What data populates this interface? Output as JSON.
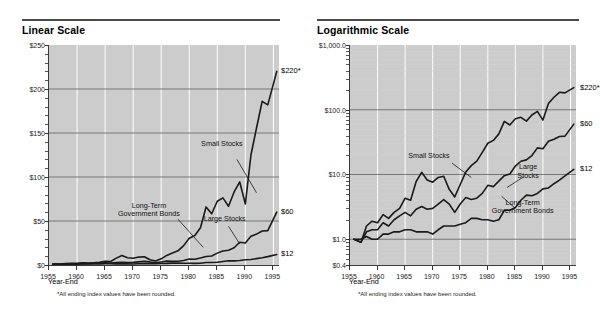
{
  "figure": {
    "width": 594,
    "height": 313,
    "background_color": "#ffffff",
    "plot_background_color": "#cccccc",
    "gridline_color": "#ffffff",
    "line_color": "#1a1a1a"
  },
  "panels": [
    {
      "key": "linear",
      "title": "Linear Scale",
      "axis_caption": "Year-End",
      "footnote": "*All ending index values have been rounded."
    },
    {
      "key": "log",
      "title": "Logarithmic Scale",
      "axis_caption": "Year-End",
      "footnote": "*All ending index values have been rounded."
    }
  ],
  "chart_data": [
    {
      "type": "line",
      "title": "Linear Scale",
      "xlabel": "Year-End",
      "ylabel": "",
      "scale": "linear",
      "xlim": [
        1955,
        1996
      ],
      "ylim": [
        0,
        250
      ],
      "grid": true,
      "legend": "annotations",
      "yticks": [
        0,
        50,
        100,
        150,
        200,
        250
      ],
      "yticklabels": [
        "$0",
        "$50",
        "$100",
        "$150",
        "$200",
        "$250"
      ],
      "xticks": [
        1955,
        1960,
        1965,
        1970,
        1975,
        1980,
        1985,
        1990,
        1995
      ],
      "xticklabels": [
        "1955",
        "1960",
        "1965",
        "1970",
        "1975",
        "1980",
        "1985",
        "1990",
        "1995"
      ],
      "annotations": [
        {
          "text": "Small Stocks",
          "x": 1986,
          "y": 137
        },
        {
          "text": "Long-Term\nGovernment Bonds",
          "x": 1973,
          "y": 62
        },
        {
          "text": "Large Stocks",
          "x": 1986.5,
          "y": 52
        }
      ],
      "end_labels": [
        {
          "text": "$220*",
          "value": 220,
          "series": "Small Stocks"
        },
        {
          "text": "$60",
          "value": 60,
          "series": "Large Stocks"
        },
        {
          "text": "$12",
          "value": 12,
          "series": "Long-Term Government Bonds"
        }
      ],
      "series": [
        {
          "name": "Small Stocks",
          "x": [
            1955.7,
            1957,
            1958,
            1959,
            1960,
            1961,
            1962,
            1963,
            1964,
            1965,
            1966,
            1967,
            1968,
            1969,
            1970,
            1971,
            1972,
            1973,
            1974,
            1975,
            1976,
            1977,
            1978,
            1979,
            1980,
            1981,
            1982,
            1983,
            1984,
            1985,
            1986,
            1987,
            1988,
            1989,
            1990,
            1991,
            1992,
            1993,
            1994,
            1995.6
          ],
          "values": [
            1.0,
            0.9,
            1.6,
            1.9,
            1.8,
            2.4,
            2.1,
            2.6,
            3.0,
            4.3,
            4.0,
            7.8,
            10.8,
            8.2,
            7.6,
            9.0,
            9.4,
            5.9,
            4.5,
            7.0,
            10.9,
            13.7,
            16.1,
            22.0,
            30.4,
            33.6,
            42.4,
            66.0,
            58.2,
            72.4,
            76.3,
            66.7,
            83.0,
            94.4,
            69.3,
            125.0,
            156.0,
            186.0,
            182.0,
            220.0
          ]
        },
        {
          "name": "Large Stocks",
          "x": [
            1955.7,
            1957,
            1958,
            1959,
            1960,
            1961,
            1962,
            1963,
            1964,
            1965,
            1966,
            1967,
            1968,
            1969,
            1970,
            1971,
            1972,
            1973,
            1974,
            1975,
            1976,
            1977,
            1978,
            1979,
            1980,
            1981,
            1982,
            1983,
            1984,
            1985,
            1986,
            1987,
            1988,
            1989,
            1990,
            1991,
            1992,
            1993,
            1994,
            1995.6
          ],
          "values": [
            1.0,
            0.9,
            1.3,
            1.4,
            1.4,
            1.8,
            1.6,
            2.0,
            2.3,
            2.6,
            2.3,
            2.9,
            3.2,
            2.9,
            3.0,
            3.5,
            4.1,
            3.5,
            2.6,
            3.5,
            4.4,
            4.1,
            4.3,
            5.1,
            6.8,
            6.5,
            7.9,
            9.6,
            10.2,
            13.5,
            16.0,
            16.8,
            19.6,
            25.8,
            25.0,
            32.6,
            35.1,
            38.6,
            39.1,
            60.0
          ]
        },
        {
          "name": "Long-Term Government Bonds",
          "x": [
            1955.7,
            1957,
            1958,
            1959,
            1960,
            1961,
            1962,
            1963,
            1964,
            1965,
            1966,
            1967,
            1968,
            1969,
            1970,
            1971,
            1972,
            1973,
            1974,
            1975,
            1976,
            1977,
            1978,
            1979,
            1980,
            1981,
            1982,
            1983,
            1984,
            1985,
            1986,
            1987,
            1988,
            1989,
            1990,
            1991,
            1992,
            1993,
            1994,
            1995.6
          ],
          "values": [
            1.0,
            1.0,
            1.1,
            1.0,
            1.0,
            1.2,
            1.2,
            1.3,
            1.3,
            1.4,
            1.4,
            1.3,
            1.3,
            1.3,
            1.2,
            1.4,
            1.6,
            1.6,
            1.6,
            1.7,
            1.8,
            2.1,
            2.1,
            2.0,
            2.0,
            1.9,
            2.0,
            2.8,
            2.8,
            3.1,
            4.0,
            4.8,
            4.7,
            5.1,
            6.0,
            6.2,
            7.2,
            8.2,
            9.5,
            12.0
          ]
        }
      ]
    },
    {
      "type": "line",
      "title": "Logarithmic Scale",
      "xlabel": "Year-End",
      "ylabel": "",
      "scale": "log",
      "xlim": [
        1955,
        1996
      ],
      "ylim": [
        0.4,
        1000
      ],
      "grid": true,
      "legend": "annotations",
      "yticks": [
        0.4,
        1,
        10,
        100,
        1000
      ],
      "yticklabels": [
        "$0.4",
        "$1.0",
        "$10.0",
        "$100.0",
        "$1,000.0"
      ],
      "xticks": [
        1955,
        1960,
        1965,
        1970,
        1975,
        1980,
        1985,
        1990,
        1995
      ],
      "xticklabels": [
        "1955",
        "1960",
        "1965",
        "1970",
        "1975",
        "1980",
        "1985",
        "1990",
        "1995"
      ],
      "annotations": [
        {
          "text": "Small Stocks",
          "x": 1969.5,
          "y": 19
        },
        {
          "text": "Large\nStocks",
          "x": 1987.5,
          "y": 11
        },
        {
          "text": "Long-Term\nGovernment Bonds",
          "x": 1986.5,
          "y": 3.1
        }
      ],
      "end_labels": [
        {
          "text": "$220*",
          "value": 220,
          "series": "Small Stocks"
        },
        {
          "text": "$60",
          "value": 60,
          "series": "Large Stocks"
        },
        {
          "text": "$12",
          "value": 12,
          "series": "Long-Term Government Bonds"
        }
      ],
      "series": [
        {
          "name": "Small Stocks",
          "x": [
            1955.7,
            1957,
            1958,
            1959,
            1960,
            1961,
            1962,
            1963,
            1964,
            1965,
            1966,
            1967,
            1968,
            1969,
            1970,
            1971,
            1972,
            1973,
            1974,
            1975,
            1976,
            1977,
            1978,
            1979,
            1980,
            1981,
            1982,
            1983,
            1984,
            1985,
            1986,
            1987,
            1988,
            1989,
            1990,
            1991,
            1992,
            1993,
            1994,
            1995.6
          ],
          "values": [
            1.0,
            0.9,
            1.6,
            1.9,
            1.8,
            2.4,
            2.1,
            2.6,
            3.0,
            4.3,
            4.0,
            7.8,
            10.8,
            8.2,
            7.6,
            9.0,
            9.4,
            5.9,
            4.5,
            7.0,
            10.9,
            13.7,
            16.1,
            22.0,
            30.4,
            33.6,
            42.4,
            66.0,
            58.2,
            72.4,
            76.3,
            66.7,
            83.0,
            94.4,
            69.3,
            125.0,
            156.0,
            186.0,
            182.0,
            220.0
          ]
        },
        {
          "name": "Large Stocks",
          "x": [
            1955.7,
            1957,
            1958,
            1959,
            1960,
            1961,
            1962,
            1963,
            1964,
            1965,
            1966,
            1967,
            1968,
            1969,
            1970,
            1971,
            1972,
            1973,
            1974,
            1975,
            1976,
            1977,
            1978,
            1979,
            1980,
            1981,
            1982,
            1983,
            1984,
            1985,
            1986,
            1987,
            1988,
            1989,
            1990,
            1991,
            1992,
            1993,
            1994,
            1995.6
          ],
          "values": [
            1.0,
            0.9,
            1.3,
            1.4,
            1.4,
            1.8,
            1.6,
            2.0,
            2.3,
            2.6,
            2.3,
            2.9,
            3.2,
            2.9,
            3.0,
            3.5,
            4.1,
            3.5,
            2.6,
            3.5,
            4.4,
            4.1,
            4.3,
            5.1,
            6.8,
            6.5,
            7.9,
            9.6,
            10.2,
            13.5,
            16.0,
            16.8,
            19.6,
            25.8,
            25.0,
            32.6,
            35.1,
            38.6,
            39.1,
            60.0
          ]
        },
        {
          "name": "Long-Term Government Bonds",
          "x": [
            1955.7,
            1957,
            1958,
            1959,
            1960,
            1961,
            1962,
            1963,
            1964,
            1965,
            1966,
            1967,
            1968,
            1969,
            1970,
            1971,
            1972,
            1973,
            1974,
            1975,
            1976,
            1977,
            1978,
            1979,
            1980,
            1981,
            1982,
            1983,
            1984,
            1985,
            1986,
            1987,
            1988,
            1989,
            1990,
            1991,
            1992,
            1993,
            1994,
            1995.6
          ],
          "values": [
            1.0,
            1.0,
            1.1,
            1.0,
            1.0,
            1.2,
            1.2,
            1.3,
            1.3,
            1.4,
            1.4,
            1.3,
            1.3,
            1.3,
            1.2,
            1.4,
            1.6,
            1.6,
            1.6,
            1.7,
            1.8,
            2.1,
            2.1,
            2.0,
            2.0,
            1.9,
            2.0,
            2.8,
            2.8,
            3.1,
            4.0,
            4.8,
            4.7,
            5.1,
            6.0,
            6.2,
            7.2,
            8.2,
            9.5,
            12.0
          ]
        }
      ]
    }
  ]
}
